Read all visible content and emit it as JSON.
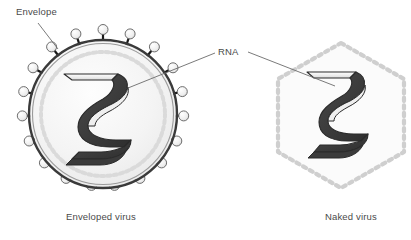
{
  "figure": {
    "type": "diagram",
    "labels": {
      "envelope": "Envelope",
      "rna": "RNA"
    },
    "captions": {
      "enveloped": "Enveloped virus",
      "naked": "Naked virus"
    },
    "colors": {
      "background": "#ffffff",
      "membrane_outer": "#3a3a3a",
      "membrane_inner": "#8a8a8a",
      "cytoplasm_fill": "#f2f2f2",
      "capsid_dots": "#d8d8d8",
      "spike_knob_fill": "#ececec",
      "spike_knob_stroke": "#6e6e6e",
      "spike_stalk": "#1a1a1a",
      "rna_dark": "#3b3b3b",
      "rna_light": "#f5f5f5",
      "rna_stroke": "#2b2b2b",
      "hexagon_border": "#cfcfcf",
      "hexagon_fill": "#fbfbfb",
      "leader_line": "#6b6b6b",
      "text": "#4a4a4a"
    },
    "enveloped_virus": {
      "center_x": 103,
      "center_y": 114,
      "membrane_radius": 74,
      "capsid_radius": 63,
      "spike_count": 20,
      "spike_knob_radius": 5
    },
    "naked_virus": {
      "center_x": 341,
      "center_y": 116,
      "hexagon_radius": 73,
      "border_style": "dotted"
    }
  }
}
